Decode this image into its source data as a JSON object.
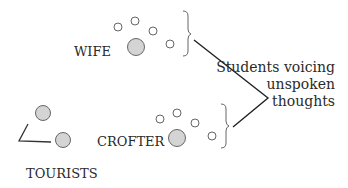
{
  "labels": {
    "wife": "WIFE",
    "crofter": "CROFTER",
    "tourists": "TOURISTS"
  },
  "annotation": {
    "line1": "Students voicing",
    "line2": "unspoken",
    "line3": "thoughts"
  },
  "colors": {
    "large_circle_fill": "#d4d4d4",
    "stroke": "#555555",
    "line": "#222222"
  }
}
